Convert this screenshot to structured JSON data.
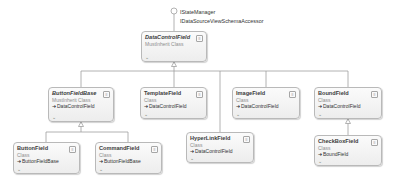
{
  "diagram": {
    "type": "class-diagram",
    "interfaces": [
      "IStateManager",
      "IDataSourceViewSchemaAccessor"
    ],
    "root": {
      "name": "DataControlField",
      "kind": "MustInherit Class",
      "abstract": true
    },
    "classes": [
      {
        "id": "buttonfieldbase",
        "name": "ButtonFieldBase",
        "kind": "MustInherit Class",
        "base": "DataControlField",
        "abstract": true
      },
      {
        "id": "templatefield",
        "name": "TemplateField",
        "kind": "Class",
        "base": "DataControlField",
        "abstract": false
      },
      {
        "id": "hyperlinkfield",
        "name": "HyperLinkField",
        "kind": "Class",
        "base": "DataControlField",
        "abstract": false
      },
      {
        "id": "imagefield",
        "name": "ImageField",
        "kind": "Class",
        "base": "DataControlField",
        "abstract": false
      },
      {
        "id": "boundfield",
        "name": "BoundField",
        "kind": "Class",
        "base": "DataControlField",
        "abstract": false
      },
      {
        "id": "buttonfield",
        "name": "ButtonField",
        "kind": "Class",
        "base": "ButtonFieldBase",
        "abstract": false
      },
      {
        "id": "commandfield",
        "name": "CommandField",
        "kind": "Class",
        "base": "ButtonFieldBase",
        "abstract": false
      },
      {
        "id": "checkboxfield",
        "name": "CheckBoxField",
        "kind": "Class",
        "base": "BoundField",
        "abstract": false
      }
    ],
    "base_arrow": "➜",
    "toggle_glyph": "≡",
    "expand_glyph": "⌄",
    "colors": {
      "line": "#a0a0a0",
      "box_border": "#b9b9b9",
      "box_fill": "#f4f4f4"
    }
  }
}
